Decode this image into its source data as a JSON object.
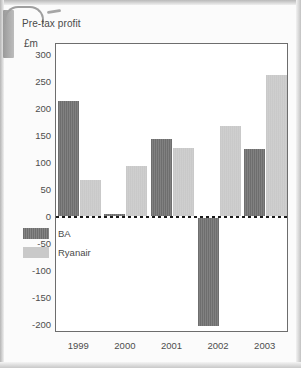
{
  "chart_data": {
    "type": "bar",
    "title": "Pre-tax profit",
    "ylabel": "£m",
    "xlabel": "",
    "categories": [
      "1999",
      "2000",
      "2001",
      "2002",
      "2003"
    ],
    "series": [
      {
        "name": "BA",
        "color": "#6e6e6e",
        "values": [
          215,
          5,
          145,
          -202,
          125
        ]
      },
      {
        "name": "Ryanair",
        "color": "#c9c9c9",
        "values": [
          68,
          95,
          128,
          168,
          263
        ]
      }
    ],
    "ylim": [
      -215,
      320
    ],
    "yticks": [
      300,
      250,
      200,
      150,
      100,
      50,
      0,
      -50,
      -100,
      -150,
      -200
    ],
    "ytick_labels": [
      "300",
      "250",
      "200",
      "150",
      "100",
      "50",
      "0",
      "-50",
      "-100",
      "-150",
      "-200"
    ],
    "grid": false,
    "zero_line": true,
    "legend_position": "inside-lower-left"
  },
  "decor": {
    "curl_bar": "page-curl-bar",
    "curl_hook": "page-curl-hook",
    "curl_tick": "page-curl-tick"
  }
}
